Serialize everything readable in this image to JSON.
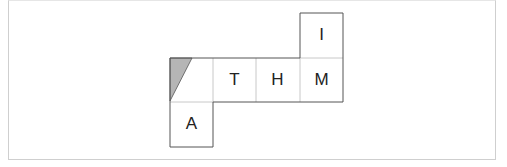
{
  "diagram": {
    "type": "cube-net",
    "colors": {
      "edge": "#555555",
      "fold": "#c8c8c8",
      "shade": "#b5b5b5"
    },
    "faces": [
      {
        "id": "shaded",
        "label": "",
        "col": 0,
        "row": 1,
        "x": 170,
        "y": 58
      },
      {
        "id": "T",
        "label": "T",
        "col": 1,
        "row": 1,
        "x": 213,
        "y": 58
      },
      {
        "id": "H",
        "label": "H",
        "col": 2,
        "row": 1,
        "x": 256,
        "y": 58
      },
      {
        "id": "M",
        "label": "M",
        "col": 3,
        "row": 1,
        "x": 300,
        "y": 58
      },
      {
        "id": "I",
        "label": "I",
        "col": 3,
        "row": 0,
        "x": 300,
        "y": 13
      },
      {
        "id": "A",
        "label": "A",
        "col": 0,
        "row": 2,
        "x": 170,
        "y": 102
      }
    ]
  }
}
